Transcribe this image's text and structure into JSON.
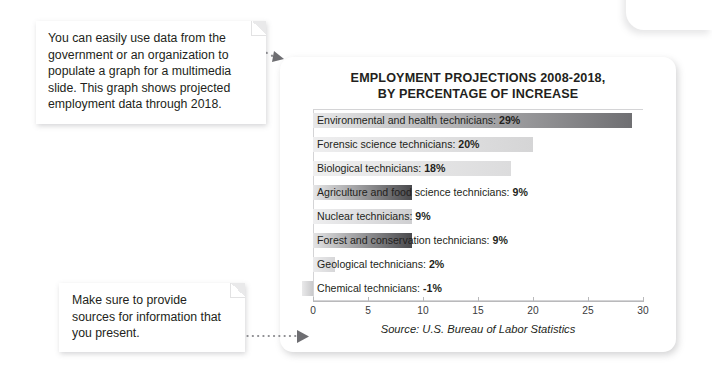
{
  "callouts": [
    {
      "id": "top",
      "text": "You can easily use data from the government or an organization to populate a graph for a multimedia slide. This graph shows projected employment data through 2018."
    },
    {
      "id": "bottom",
      "text": "Make sure to provide sources for information that you present."
    }
  ],
  "chart_card": {
    "title": "EMPLOYMENT PROJECTIONS 2008-2018,\nBY PERCENTAGE OF INCREASE",
    "source_note": "Source: U.S. Bureau of Labor Statistics"
  },
  "chart_data": {
    "type": "bar",
    "orientation": "horizontal",
    "xlabel": "",
    "ylabel": "",
    "xlim": [
      0,
      30
    ],
    "xticks": [
      0,
      5,
      10,
      15,
      20,
      25,
      30
    ],
    "grid": false,
    "legend": false,
    "source": "Source: U.S. Bureau of Labor Statistics",
    "categories": [
      "Environmental and health technicians",
      "Forensic science technicians",
      "Biological technicians",
      "Agriculture and food science technicians",
      "Nuclear technicians",
      "Forest and conservation technicians",
      "Geological technicians",
      "Chemical technicians"
    ],
    "values": [
      29,
      20,
      18,
      9,
      9,
      9,
      2,
      -1
    ],
    "bar_labels": [
      "Environmental and health technicians: 29%",
      "Forensic science technicians: 20%",
      "Biological technicians: 18%",
      "Agriculture and food science technicians: 9%",
      "Nuclear technicians: 9%",
      "Forest and conservation technicians: 9%",
      "Geological technicians: 2%",
      "Chemical technicians: -1%"
    ],
    "bar_value_text": [
      "29%",
      "20%",
      "18%",
      "9%",
      "9%",
      "9%",
      "2%",
      "-1%"
    ],
    "bar_colors_start": [
      "#e8e8e9",
      "#eeeeef",
      "#efefef",
      "#e6e6e7",
      "#eeeeef",
      "#e4e4e5",
      "#ebebec",
      "#e9e9ea"
    ],
    "bar_colors_end": [
      "#6f6f72",
      "#d5d5d6",
      "#dcdcdd",
      "#4a4a4d",
      "#cfcfd1",
      "#49494c",
      "#d6d6d8",
      "#c9c9cb"
    ]
  }
}
